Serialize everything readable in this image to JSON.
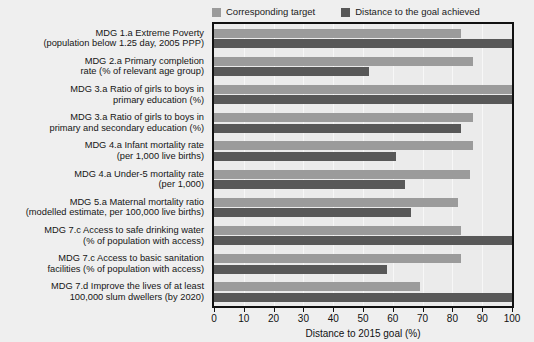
{
  "legend": {
    "entries": [
      {
        "label": "Corresponding target",
        "color": "#9b9b9b",
        "icon": "square-swatch-icon"
      },
      {
        "label": "Distance to the goal achieved",
        "color": "#585858",
        "icon": "square-swatch-icon"
      }
    ]
  },
  "axis": {
    "x_title": "Distance to 2015 goal (%)",
    "x_ticks": [
      "0",
      "10",
      "20",
      "30",
      "40",
      "50",
      "60",
      "70",
      "80",
      "90",
      "100"
    ]
  },
  "chart_data": {
    "type": "bar",
    "orientation": "horizontal",
    "title": "",
    "subtitle": "",
    "xlabel": "Distance to 2015 goal (%)",
    "ylabel": "",
    "xlim": [
      0,
      100
    ],
    "grid": true,
    "legend_position": "top-right",
    "categories": [
      [
        "MDG 1.a Extreme Poverty",
        "(population below 1.25 day, 2005 PPP)"
      ],
      [
        "MDG 2.a Primary completion",
        "rate (% of relevant age group)"
      ],
      [
        "MDG 3.a Ratio of girls to boys in",
        "primary education (%)"
      ],
      [
        "MDG 3.a Ratio of girls to boys in",
        "primary and secondary education (%)"
      ],
      [
        "MDG 4.a Infant mortality rate",
        "(per 1,000 live births)"
      ],
      [
        "MDG 4.a Under-5 mortality rate",
        "(per 1,000)"
      ],
      [
        "MDG 5.a Maternal mortality ratio",
        "(modelled estimate, per 100,000 live births)"
      ],
      [
        "MDG 7.c Access to safe drinking water",
        "(% of population with access)"
      ],
      [
        "MDG 7.c Access to basic sanitation",
        "facilities (% of population with access)"
      ],
      [
        "MDG 7.d Improve the lives of at least",
        "100,000 slum dwellers (by 2020)"
      ]
    ],
    "series": [
      {
        "name": "Corresponding target",
        "color": "#9b9b9b",
        "values": [
          83,
          87,
          100,
          87,
          87,
          86,
          82,
          83,
          83,
          69
        ]
      },
      {
        "name": "Distance to the goal achieved",
        "color": "#585858",
        "values": [
          100,
          52,
          100,
          83,
          61,
          64,
          66,
          100,
          58,
          100
        ]
      }
    ]
  }
}
